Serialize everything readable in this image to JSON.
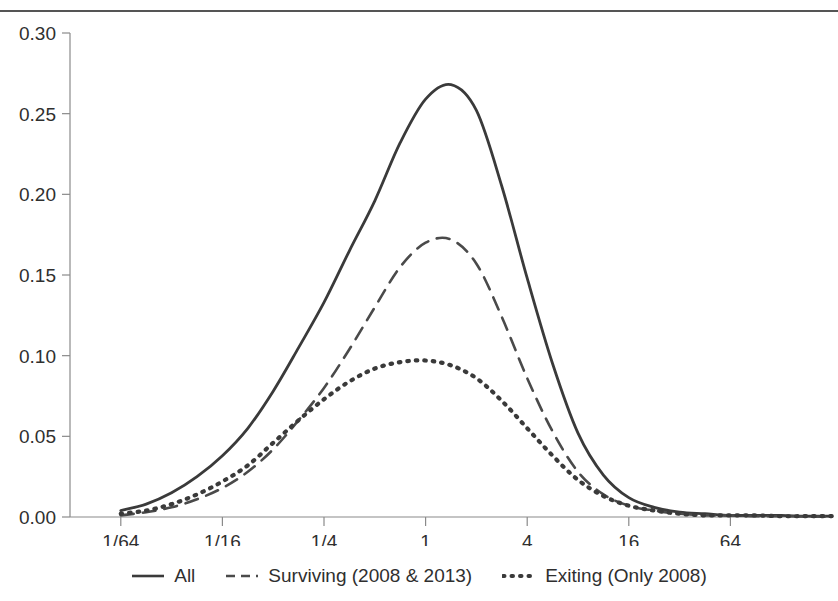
{
  "figure": {
    "has_top_rule": true,
    "background_color": "#ffffff",
    "line_color": "#3a3a3a"
  },
  "chart_data": {
    "type": "line",
    "title": "",
    "subtitle": "",
    "xlabel": "",
    "ylabel": "",
    "x_scale": "log2",
    "grid": false,
    "legend_position": "bottom",
    "xlim": [
      0.0078125,
      256
    ],
    "ylim": [
      0.0,
      0.3
    ],
    "ytick_labels": [
      "0.00",
      "0.05",
      "0.10",
      "0.15",
      "0.20",
      "0.25",
      "0.30"
    ],
    "ytick_values": [
      0.0,
      0.05,
      0.1,
      0.15,
      0.2,
      0.25,
      0.3
    ],
    "xtick_labels": [
      "1/64",
      "1/16",
      "1/4",
      "1",
      "4",
      "16",
      "64"
    ],
    "xtick_values": [
      0.015625,
      0.0625,
      0.25,
      1,
      4,
      16,
      64
    ],
    "x": [
      0.015625,
      0.0221,
      0.03125,
      0.0442,
      0.0625,
      0.0884,
      0.125,
      0.1768,
      0.25,
      0.3536,
      0.5,
      0.7071,
      1.0,
      1.4142,
      2.0,
      2.8284,
      4.0,
      5.657,
      8.0,
      11.314,
      16.0,
      22.63,
      32.0,
      45.25,
      64.0,
      90.5,
      128.0,
      181.0,
      256.0
    ],
    "series": [
      {
        "name": "All",
        "style": "solid",
        "color": "#3a3a3a",
        "values": [
          0.004,
          0.008,
          0.015,
          0.025,
          0.038,
          0.055,
          0.078,
          0.105,
          0.133,
          0.165,
          0.196,
          0.232,
          0.259,
          0.268,
          0.252,
          0.205,
          0.148,
          0.095,
          0.052,
          0.026,
          0.012,
          0.006,
          0.003,
          0.002,
          0.001,
          0.001,
          0.001,
          0.0005,
          0.0005
        ]
      },
      {
        "name": "Surviving (2008 & 2013)",
        "style": "dashed",
        "color": "#4a4a4a",
        "values": [
          0.001,
          0.003,
          0.006,
          0.011,
          0.018,
          0.028,
          0.042,
          0.06,
          0.08,
          0.104,
          0.13,
          0.155,
          0.17,
          0.172,
          0.157,
          0.124,
          0.086,
          0.053,
          0.028,
          0.014,
          0.007,
          0.004,
          0.002,
          0.001,
          0.001,
          0.0005,
          0.0005,
          0.0003,
          0.0003
        ]
      },
      {
        "name": "Exiting (Only 2008)",
        "style": "dotted",
        "color": "#3a3a3a",
        "values": [
          0.002,
          0.004,
          0.008,
          0.014,
          0.022,
          0.032,
          0.046,
          0.06,
          0.073,
          0.084,
          0.092,
          0.096,
          0.097,
          0.094,
          0.086,
          0.072,
          0.055,
          0.038,
          0.023,
          0.013,
          0.007,
          0.004,
          0.002,
          0.001,
          0.001,
          0.001,
          0.0005,
          0.0005,
          0.0005
        ]
      }
    ],
    "legend_entries": [
      {
        "label": "All",
        "style": "solid"
      },
      {
        "label": "Surviving (2008 & 2013)",
        "style": "dashed"
      },
      {
        "label": "Exiting (Only 2008)",
        "style": "dotted"
      }
    ]
  }
}
